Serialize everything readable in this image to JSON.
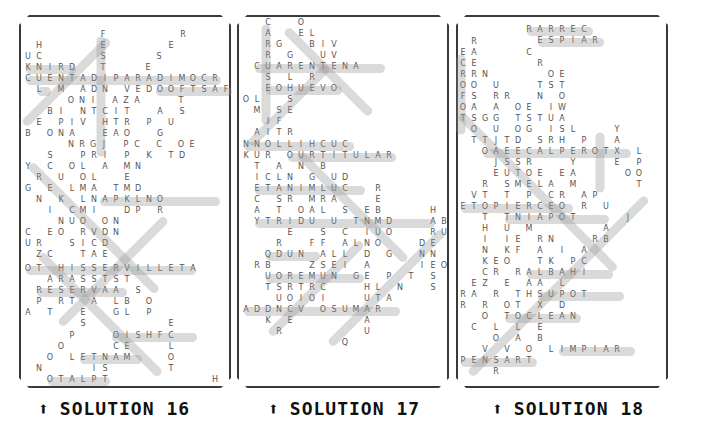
{
  "panels": [
    {
      "id": "solution-16",
      "caption": "SOLUTION 16",
      "arrow": "⬆",
      "rows": [
        {
          "y": 34,
          "x0": 103,
          "text": "F"
        },
        {
          "y": 34,
          "x0": 183,
          "text": "R"
        },
        {
          "y": 45,
          "x0": 39,
          "text": "H"
        },
        {
          "y": 45,
          "x0": 103,
          "text": "E"
        },
        {
          "y": 45,
          "x0": 171,
          "text": "E"
        },
        {
          "y": 56,
          "x0": 28,
          "text": "U C"
        },
        {
          "y": 56,
          "x0": 103,
          "text": "S"
        },
        {
          "y": 56,
          "x0": 159,
          "text": "S"
        },
        {
          "y": 67,
          "x0": 28,
          "text": "K N I R D"
        },
        {
          "y": 67,
          "x0": 103,
          "text": "T"
        },
        {
          "y": 67,
          "x0": 148,
          "text": "E"
        },
        {
          "y": 78,
          "x0": 28,
          "text": "C U E N T A D I P A R A D I M O C R"
        },
        {
          "y": 89,
          "x0": 39,
          "text": "L   M   A D N   V E D O O F T S A F"
        },
        {
          "y": 100,
          "x0": 71,
          "text": "O N I   A Z A       T"
        },
        {
          "y": 111,
          "x0": 50,
          "text": "B I   N T C I T     A   S"
        },
        {
          "y": 122,
          "x0": 39,
          "text": "E   P I V   H T R   P   U"
        },
        {
          "y": 133,
          "x0": 28,
          "text": "B   O N A     E A O     G"
        },
        {
          "y": 144,
          "x0": 71,
          "text": "N R G J   P C   C   O E"
        },
        {
          "y": 155,
          "x0": 50,
          "text": "S     P R I   P   K   T D"
        },
        {
          "y": 166,
          "x0": 28,
          "text": "Y   C   O L   A   M N"
        },
        {
          "y": 177,
          "x0": 39,
          "text": "R   U   O L     E"
        },
        {
          "y": 188,
          "x0": 28,
          "text": "G   E   L M A   T M D"
        },
        {
          "y": 199,
          "x0": 39,
          "text": "N   K   L N A P K L N O"
        },
        {
          "y": 210,
          "x0": 50,
          "text": "I   C M I     D P   R"
        },
        {
          "y": 221,
          "x0": 61,
          "text": "N U O   O N"
        },
        {
          "y": 232,
          "x0": 28,
          "text": "C   E O   R V D N"
        },
        {
          "y": 243,
          "x0": 28,
          "text": "U R     S I C D"
        },
        {
          "y": 254,
          "x0": 39,
          "text": "Z C     T A E"
        },
        {
          "y": 268,
          "x0": 28,
          "text": "O T   H I S S E R V I L L E T A"
        },
        {
          "y": 279,
          "x0": 50,
          "text": "A R A S S T S T"
        },
        {
          "y": 290,
          "x0": 39,
          "text": "R E S E R V A A   S"
        },
        {
          "y": 301,
          "x0": 39,
          "text": "P   R T   A   L B   O"
        },
        {
          "y": 312,
          "x0": 28,
          "text": "A   T     E     G L   P"
        },
        {
          "y": 323,
          "x0": 83,
          "text": "S               E"
        },
        {
          "y": 335,
          "x0": 72,
          "text": "P       O I S H F C"
        },
        {
          "y": 346,
          "x0": 61,
          "text": "O         C E       L"
        },
        {
          "y": 357,
          "x0": 50,
          "text": "O   L E T N A M       O"
        },
        {
          "y": 368,
          "x0": 39,
          "text": "N         I S           T"
        },
        {
          "y": 379,
          "x0": 50,
          "text": "O T A L P T                   H"
        }
      ]
    },
    {
      "id": "solution-17",
      "caption": "SOLUTION 17",
      "arrow": "⬆",
      "rows": [
        {
          "y": 22,
          "x0": 268,
          "text": "C     O"
        },
        {
          "y": 33,
          "x0": 268,
          "text": "A     E L"
        },
        {
          "y": 44,
          "x0": 268,
          "text": "R G     B I V"
        },
        {
          "y": 55,
          "x0": 268,
          "text": "R   G     U V"
        },
        {
          "y": 66,
          "x0": 257,
          "text": "C U A R E N T E N A"
        },
        {
          "y": 77,
          "x0": 268,
          "text": "S   L   R"
        },
        {
          "y": 88,
          "x0": 268,
          "text": "E O H U E V O"
        },
        {
          "y": 99,
          "x0": 246,
          "text": "O L     S"
        },
        {
          "y": 110,
          "x0": 257,
          "text": "M   S E"
        },
        {
          "y": 121,
          "x0": 268,
          "text": "I F"
        },
        {
          "y": 132,
          "x0": 257,
          "text": "A I T R"
        },
        {
          "y": 144,
          "x0": 246,
          "text": "N N O L L I H C U C"
        },
        {
          "y": 155,
          "x0": 246,
          "text": "K U R   O U R T I T U L A R"
        },
        {
          "y": 166,
          "x0": 257,
          "text": "T   A   N   B"
        },
        {
          "y": 177,
          "x0": 257,
          "text": "I C L N   G   U D"
        },
        {
          "y": 188,
          "x0": 257,
          "text": "E T A N I M L U C     R"
        },
        {
          "y": 199,
          "x0": 257,
          "text": "C   S R   M R A       E"
        },
        {
          "y": 210,
          "x0": 257,
          "text": "A   T   O A L   S   E B         H"
        },
        {
          "y": 221,
          "x0": 257,
          "text": "Y T R I D U   U   T N M D       A B"
        },
        {
          "y": 232,
          "x0": 290,
          "text": "E     S   C   I U O       R U"
        },
        {
          "y": 243,
          "x0": 279,
          "text": "R     F F   A L N O       D E"
        },
        {
          "y": 254,
          "x0": 268,
          "text": "Q D U N   A L L   D   G     N N"
        },
        {
          "y": 265,
          "x0": 257,
          "text": "R B       Z S E I   A         I E O"
        },
        {
          "y": 276,
          "x0": 268,
          "text": "U O R E M U N   G E   P   T   S"
        },
        {
          "y": 287,
          "x0": 268,
          "text": "T S R T R C       H L   N     S"
        },
        {
          "y": 298,
          "x0": 279,
          "text": "U O I O I       U T A"
        },
        {
          "y": 309,
          "x0": 246,
          "text": "A D D N C V   O S U M A R"
        },
        {
          "y": 320,
          "x0": 268,
          "text": "K   E             A"
        },
        {
          "y": 331,
          "x0": 279,
          "text": "R               U"
        },
        {
          "y": 342,
          "x0": 345,
          "text": "Q"
        }
      ]
    },
    {
      "id": "solution-18",
      "caption": "SOLUTION 18",
      "arrow": "⬆",
      "rows": [
        {
          "y": 29,
          "x0": 529,
          "text": "R A R R E C"
        },
        {
          "y": 40,
          "x0": 540,
          "text": "E S P I A R"
        },
        {
          "y": 41,
          "x0": 474,
          "text": "R"
        },
        {
          "y": 52,
          "x0": 463,
          "text": "E A         C"
        },
        {
          "y": 63,
          "x0": 463,
          "text": "C E           R"
        },
        {
          "y": 74,
          "x0": 463,
          "text": "R R N           O E"
        },
        {
          "y": 85,
          "x0": 463,
          "text": "O O   U       T S T"
        },
        {
          "y": 96,
          "x0": 463,
          "text": "F S   R R     N   O"
        },
        {
          "y": 107,
          "x0": 463,
          "text": "O A   A   O E   I W"
        },
        {
          "y": 118,
          "x0": 463,
          "text": "T S G G   T S T U A"
        },
        {
          "y": 129,
          "x0": 474,
          "text": "O   U   O G   I S L       Y"
        },
        {
          "y": 140,
          "x0": 474,
          "text": "T T J T D   S R H   P     A"
        },
        {
          "y": 151,
          "x0": 485,
          "text": "O A E E C A L P E R O T X   L"
        },
        {
          "y": 162,
          "x0": 496,
          "text": "J S S R       Y       E   P"
        },
        {
          "y": 173,
          "x0": 496,
          "text": "E U T O E   E A         O O"
        },
        {
          "y": 184,
          "x0": 485,
          "text": "R   S M E L A   M           T"
        },
        {
          "y": 195,
          "x0": 474,
          "text": "V T   T   P   C R   A P"
        },
        {
          "y": 206,
          "x0": 463,
          "text": "E T O P I E R C E O   R   U"
        },
        {
          "y": 217,
          "x0": 485,
          "text": "T   T N I A P O T         J"
        },
        {
          "y": 228,
          "x0": 485,
          "text": "H   U   M             A"
        },
        {
          "y": 239,
          "x0": 485,
          "text": "I   I E   R N       R B"
        },
        {
          "y": 250,
          "x0": 485,
          "text": "N   K F   A   I   A"
        },
        {
          "y": 261,
          "x0": 485,
          "text": "K E O     T K   P C"
        },
        {
          "y": 272,
          "x0": 485,
          "text": "C R   R A L B A H I"
        },
        {
          "y": 283,
          "x0": 474,
          "text": "E Z   E   A A   L"
        },
        {
          "y": 294,
          "x0": 463,
          "text": "R A   R   T H S U P O T"
        },
        {
          "y": 305,
          "x0": 463,
          "text": "R   R   O T   X   D"
        },
        {
          "y": 316,
          "x0": 485,
          "text": "O   T O C L E A N"
        },
        {
          "y": 327,
          "x0": 474,
          "text": "C   L   L   E"
        },
        {
          "y": 338,
          "x0": 496,
          "text": "O   A   B"
        },
        {
          "y": 349,
          "x0": 485,
          "text": "V   V   O   L I M P I A R"
        },
        {
          "y": 360,
          "x0": 463,
          "text": "P E N S A R T"
        },
        {
          "y": 371,
          "x0": 496,
          "text": "R"
        }
      ]
    }
  ],
  "highlights_color": "#c8c8c8",
  "letter_color": "#555555",
  "border_color": "#333333"
}
